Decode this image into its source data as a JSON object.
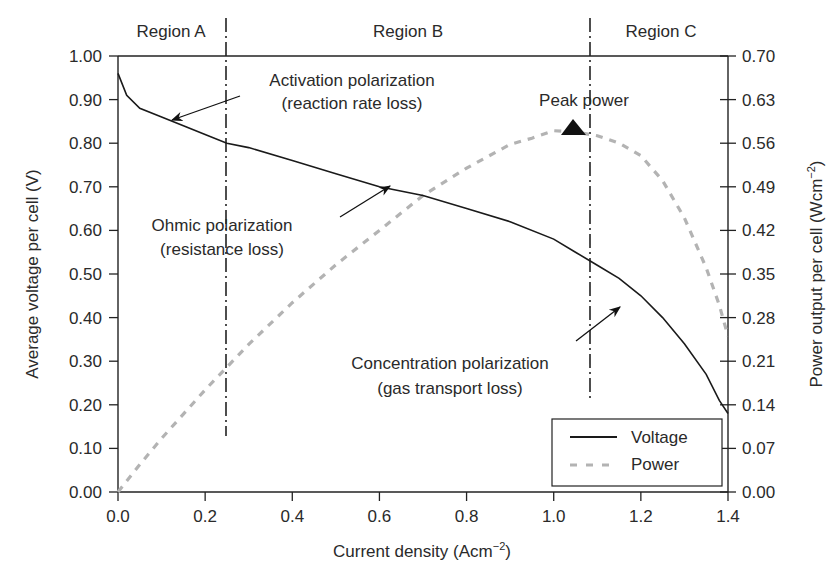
{
  "chart_data": {
    "type": "line",
    "title": "",
    "xlabel": "Current density (Acm−2)",
    "xlabel_main": "Current density (Acm",
    "xlabel_sup": "−2",
    "xlabel_close": ")",
    "ylabel_left": "Average voltage per cell (V)",
    "ylabel_right": "Power output per cell (Wcm−2)",
    "ylabel_right_main": "Power output per cell (Wcm",
    "ylabel_right_sup": "−2",
    "ylabel_right_close": ")",
    "xlim": [
      0.0,
      1.4
    ],
    "ylim_left": [
      0.0,
      1.0
    ],
    "ylim_right": [
      0.0,
      0.7
    ],
    "x_ticks": [
      "0.0",
      "0.2",
      "0.4",
      "0.6",
      "0.8",
      "1.0",
      "1.2",
      "1.4"
    ],
    "y_left_ticks": [
      "0.00",
      "0.10",
      "0.20",
      "0.30",
      "0.40",
      "0.50",
      "0.60",
      "0.70",
      "0.80",
      "0.90",
      "1.00"
    ],
    "y_right_ticks": [
      "0.00",
      "0.07",
      "0.14",
      "0.21",
      "0.28",
      "0.35",
      "0.42",
      "0.49",
      "0.56",
      "0.63",
      "0.70"
    ],
    "grid": false,
    "legend_position": "lower right",
    "series": [
      {
        "name": "Voltage",
        "axis": "left",
        "style": "solid",
        "color": "#1a1a1a",
        "x": [
          0.0,
          0.02,
          0.05,
          0.1,
          0.15,
          0.2,
          0.25,
          0.3,
          0.4,
          0.5,
          0.6,
          0.7,
          0.8,
          0.9,
          1.0,
          1.05,
          1.1,
          1.15,
          1.2,
          1.25,
          1.3,
          1.35,
          1.38,
          1.4
        ],
        "values": [
          0.96,
          0.91,
          0.88,
          0.86,
          0.84,
          0.82,
          0.8,
          0.79,
          0.76,
          0.73,
          0.7,
          0.68,
          0.65,
          0.62,
          0.58,
          0.55,
          0.52,
          0.49,
          0.45,
          0.4,
          0.34,
          0.27,
          0.21,
          0.18
        ]
      },
      {
        "name": "Power",
        "axis": "right",
        "style": "dashed",
        "color": "#b0b0b0",
        "x": [
          0.0,
          0.05,
          0.1,
          0.2,
          0.3,
          0.4,
          0.5,
          0.6,
          0.7,
          0.8,
          0.9,
          0.95,
          1.0,
          1.05,
          1.1,
          1.15,
          1.2,
          1.25,
          1.3,
          1.35,
          1.38,
          1.4
        ],
        "values": [
          0.0,
          0.044,
          0.086,
          0.164,
          0.237,
          0.304,
          0.365,
          0.42,
          0.476,
          0.52,
          0.558,
          0.568,
          0.58,
          0.578,
          0.572,
          0.56,
          0.54,
          0.5,
          0.44,
          0.36,
          0.3,
          0.25
        ]
      }
    ],
    "regions": [
      {
        "label": "Region A",
        "x_start": 0.0,
        "x_end": 0.25
      },
      {
        "label": "Region B",
        "x_start": 0.25,
        "x_end": 1.083
      },
      {
        "label": "Region C",
        "x_start": 1.083,
        "x_end": 1.4
      }
    ],
    "region_boundaries": [
      0.25,
      1.083
    ],
    "annotations": [
      {
        "text": [
          "Activation polarization",
          "(reaction rate loss)"
        ],
        "arrow_to": [
          0.12,
          0.85
        ]
      },
      {
        "text": [
          "Ohmic polarization",
          "(resistance loss)"
        ],
        "arrow_to": [
          0.63,
          0.705
        ]
      },
      {
        "text": [
          "Concentration polarization",
          "(gas transport loss)"
        ],
        "arrow_to": [
          1.23,
          0.43
        ]
      },
      {
        "text": [
          "Peak power"
        ],
        "marker": "triangle",
        "at": [
          1.04,
          0.58
        ]
      }
    ]
  }
}
